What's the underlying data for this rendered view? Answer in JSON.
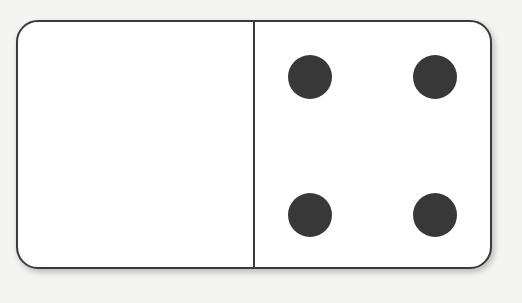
{
  "domino": {
    "left_half": {
      "value": 0,
      "pips": []
    },
    "right_half": {
      "value": 4,
      "pips": [
        {
          "x": 55,
          "y": 55
        },
        {
          "x": 180,
          "y": 55
        },
        {
          "x": 55,
          "y": 193
        },
        {
          "x": 180,
          "y": 193
        }
      ]
    },
    "colors": {
      "border": "#3a3a3a",
      "pip": "#383838",
      "face": "#ffffff",
      "background": "#f4f4f2"
    }
  }
}
